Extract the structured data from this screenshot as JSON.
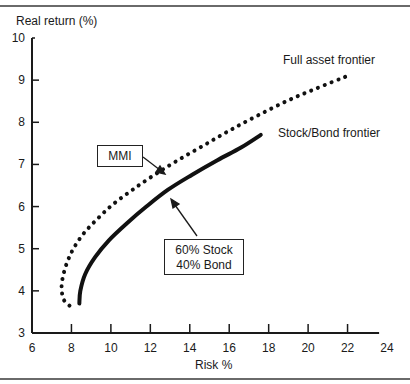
{
  "chart_data": {
    "type": "line",
    "title": "",
    "xlabel": "Risk %",
    "ylabel": "Real return (%)",
    "xlim": [
      6,
      24
    ],
    "ylim": [
      3,
      10
    ],
    "x_ticks": [
      6,
      8,
      10,
      12,
      14,
      16,
      18,
      20,
      22,
      24
    ],
    "y_ticks": [
      3,
      4,
      5,
      6,
      7,
      8,
      9,
      10
    ],
    "grid": false,
    "legend": "none (curves labeled directly)",
    "series": [
      {
        "name": "Full asset frontier",
        "style": "dotted",
        "points": [
          [
            7.9,
            3.65
          ],
          [
            7.6,
            3.8
          ],
          [
            7.5,
            4.1
          ],
          [
            7.6,
            4.4
          ],
          [
            7.8,
            4.7
          ],
          [
            8.1,
            5.0
          ],
          [
            8.6,
            5.35
          ],
          [
            9.3,
            5.7
          ],
          [
            10.1,
            6.05
          ],
          [
            11.1,
            6.4
          ],
          [
            12.2,
            6.75
          ],
          [
            13.4,
            7.1
          ],
          [
            14.7,
            7.45
          ],
          [
            16.0,
            7.8
          ],
          [
            17.4,
            8.15
          ],
          [
            18.9,
            8.5
          ],
          [
            20.4,
            8.8
          ],
          [
            22.0,
            9.1
          ]
        ]
      },
      {
        "name": "Stock/Bond frontier",
        "style": "solid",
        "points": [
          [
            8.4,
            3.7
          ],
          [
            8.45,
            4.0
          ],
          [
            8.7,
            4.4
          ],
          [
            9.2,
            4.8
          ],
          [
            9.9,
            5.2
          ],
          [
            10.8,
            5.6
          ],
          [
            11.8,
            6.0
          ],
          [
            12.9,
            6.4
          ],
          [
            14.1,
            6.75
          ],
          [
            15.4,
            7.1
          ],
          [
            16.6,
            7.4
          ],
          [
            17.6,
            7.7
          ]
        ]
      }
    ],
    "annotations": [
      {
        "text": "Full asset frontier",
        "x": 19.3,
        "y": 9.45
      },
      {
        "text": "Stock/Bond frontier",
        "x": 17.8,
        "y": 7.7
      },
      {
        "text": "MMI",
        "box": true,
        "arrow_to": [
          12.8,
          6.9
        ]
      },
      {
        "text": "60% Stock\n40% Bond",
        "box": true,
        "arrow_to": [
          12.5,
          6.4
        ]
      }
    ]
  },
  "labels": {
    "y_axis_title": "Real return (%)",
    "x_axis_title": "Risk %",
    "full_frontier": "Full asset frontier",
    "stock_bond_frontier": "Stock/Bond frontier",
    "mmi": "MMI",
    "mix_line1": "60% Stock",
    "mix_line2": "40% Bond"
  }
}
